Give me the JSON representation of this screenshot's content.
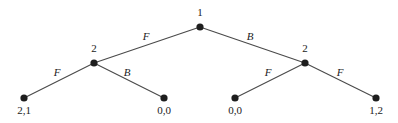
{
  "diagram": {
    "type": "extensive-form game tree",
    "nodes": {
      "root": {
        "player": "1",
        "x": 200,
        "y": 27
      },
      "left": {
        "player": "2",
        "x": 94,
        "y": 63
      },
      "right": {
        "player": "2",
        "x": 305,
        "y": 63
      }
    },
    "edges": {
      "root_left": {
        "action": "F"
      },
      "root_right": {
        "action": "B"
      },
      "left_ll": {
        "action": "F"
      },
      "left_lr": {
        "action": "B"
      },
      "right_rl": {
        "action": "F"
      },
      "right_rr": {
        "action": "F"
      }
    },
    "leaves": [
      {
        "payoff": "2,1",
        "x": 24,
        "y": 98
      },
      {
        "payoff": "0,0",
        "x": 164,
        "y": 98
      },
      {
        "payoff": "0,0",
        "x": 235,
        "y": 98
      },
      {
        "payoff": "1,2",
        "x": 376,
        "y": 98
      }
    ]
  }
}
